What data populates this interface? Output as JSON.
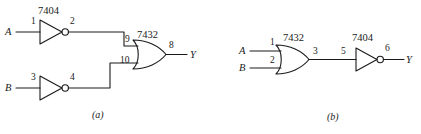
{
  "figure": {
    "type": "logic-circuit-diagram",
    "panels": [
      {
        "id": "a",
        "caption": "(a)",
        "description": "Two inverters feeding an OR gate",
        "chips": [
          {
            "name": "7404",
            "kind": "inverter"
          },
          {
            "name": "7432",
            "kind": "or-gate"
          }
        ],
        "inputs": [
          {
            "label": "A"
          },
          {
            "label": "B"
          }
        ],
        "outputs": [
          {
            "label": "Y"
          }
        ],
        "pins": {
          "inv1_in": "1",
          "inv1_out": "2",
          "inv2_in": "3",
          "inv2_out": "4",
          "or_in_top": "9",
          "or_in_bottom": "10",
          "or_out": "8"
        }
      },
      {
        "id": "b",
        "caption": "(b)",
        "description": "OR gate feeding an inverter",
        "chips": [
          {
            "name": "7432",
            "kind": "or-gate"
          },
          {
            "name": "7404",
            "kind": "inverter"
          }
        ],
        "inputs": [
          {
            "label": "A"
          },
          {
            "label": "B"
          }
        ],
        "outputs": [
          {
            "label": "Y"
          }
        ],
        "pins": {
          "or_in_top": "1",
          "or_in_bottom": "2",
          "or_out": "3",
          "inv_in": "5",
          "inv_out": "6"
        }
      }
    ],
    "colors": {
      "line": "#1a1a1a",
      "text": "#1a1a1a",
      "background": "#ffffff"
    }
  }
}
